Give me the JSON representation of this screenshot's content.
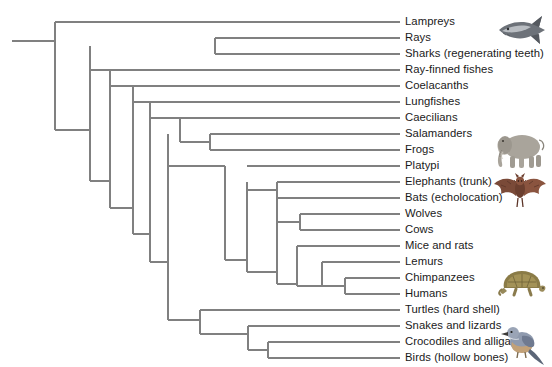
{
  "figure": {
    "name": "vertebrate-cladogram",
    "background_color": "#ffffff",
    "line_color": "#808080",
    "text_color": "#1a1a1a"
  },
  "taxa": [
    {
      "id": "lampreys",
      "label": "Lampreys",
      "y": 22,
      "tip_x": 400,
      "node_x": 55
    },
    {
      "id": "rays",
      "label": "Rays",
      "y": 38,
      "tip_x": 400,
      "node_x": 215
    },
    {
      "id": "sharks",
      "label": "Sharks (regenerating teeth)",
      "y": 54,
      "tip_x": 400,
      "node_x": 215
    },
    {
      "id": "rayfinned",
      "label": "Ray-finned fishes",
      "y": 70,
      "tip_x": 400,
      "node_x": 90
    },
    {
      "id": "coelacanths",
      "label": "Coelacanths",
      "y": 86,
      "tip_x": 400,
      "node_x": 110
    },
    {
      "id": "lungfishes",
      "label": "Lungfishes",
      "y": 102,
      "tip_x": 400,
      "node_x": 133
    },
    {
      "id": "caecilians",
      "label": "Caecilians",
      "y": 118,
      "tip_x": 400,
      "node_x": 180
    },
    {
      "id": "salamanders",
      "label": "Salamanders",
      "y": 134,
      "tip_x": 400,
      "node_x": 210
    },
    {
      "id": "frogs",
      "label": "Frogs",
      "y": 150,
      "tip_x": 400,
      "node_x": 210
    },
    {
      "id": "platypi",
      "label": "Platypi",
      "y": 166,
      "tip_x": 400,
      "node_x": 247
    },
    {
      "id": "elephants",
      "label": "Elephants (trunk)",
      "y": 182,
      "tip_x": 400,
      "node_x": 277
    },
    {
      "id": "bats",
      "label": "Bats (echolocation)",
      "y": 198,
      "tip_x": 400,
      "node_x": 277
    },
    {
      "id": "wolves",
      "label": "Wolves",
      "y": 214,
      "tip_x": 400,
      "node_x": 300
    },
    {
      "id": "cows",
      "label": "Cows",
      "y": 230,
      "tip_x": 400,
      "node_x": 300
    },
    {
      "id": "mice",
      "label": "Mice and rats",
      "y": 246,
      "tip_x": 400,
      "node_x": 297
    },
    {
      "id": "lemurs",
      "label": "Lemurs",
      "y": 262,
      "tip_x": 400,
      "node_x": 322
    },
    {
      "id": "chimps",
      "label": "Chimpanzees",
      "y": 278,
      "tip_x": 400,
      "node_x": 345
    },
    {
      "id": "humans",
      "label": "Humans",
      "y": 294,
      "tip_x": 400,
      "node_x": 345
    },
    {
      "id": "turtles",
      "label": "Turtles (hard shell)",
      "y": 310,
      "tip_x": 400,
      "node_x": 200
    },
    {
      "id": "snakes",
      "label": "Snakes and lizards",
      "y": 326,
      "tip_x": 400,
      "node_x": 248
    },
    {
      "id": "crocodiles",
      "label": "Crocodiles and alligators",
      "y": 342,
      "tip_x": 400,
      "node_x": 268
    },
    {
      "id": "birds",
      "label": "Birds (hollow bones)",
      "y": 358,
      "tip_x": 400,
      "node_x": 268
    }
  ],
  "nodes": [
    {
      "id": "root",
      "x": 55,
      "y_top": 22,
      "y_bottom": 130
    },
    {
      "id": "gnathostomes",
      "x": 90,
      "y_top": 46,
      "y_bottom": 181
    },
    {
      "id": "chondrichthyes",
      "x": 215,
      "y_top": 38,
      "y_bottom": 54
    },
    {
      "id": "bony-vertebrates",
      "x": 110,
      "y_top": 70,
      "y_bottom": 208
    },
    {
      "id": "sarcopterygii",
      "x": 133,
      "y_top": 86,
      "y_bottom": 234
    },
    {
      "id": "tetrapods",
      "x": 150,
      "y_top": 102,
      "y_bottom": 262
    },
    {
      "id": "amphibians",
      "x": 180,
      "y_top": 118,
      "y_bottom": 142
    },
    {
      "id": "frog-salamander",
      "x": 210,
      "y_top": 134,
      "y_bottom": 150
    },
    {
      "id": "amniotes",
      "x": 168,
      "y_top": 134,
      "y_bottom": 320
    },
    {
      "id": "mammals",
      "x": 225,
      "y_top": 166,
      "y_bottom": 260
    },
    {
      "id": "theria",
      "x": 247,
      "y_top": 182,
      "y_bottom": 272
    },
    {
      "id": "laurasiatheria",
      "x": 277,
      "y_top": 190,
      "y_bottom": 222
    },
    {
      "id": "afrotheria-bats",
      "x": 277,
      "y_top": 182,
      "y_bottom": 198
    },
    {
      "id": "euarchontoglires",
      "x": 277,
      "y_top": 222,
      "y_bottom": 284
    },
    {
      "id": "carnivora",
      "x": 300,
      "y_top": 214,
      "y_bottom": 230
    },
    {
      "id": "glires-primates",
      "x": 297,
      "y_top": 246,
      "y_bottom": 286
    },
    {
      "id": "primates",
      "x": 322,
      "y_top": 262,
      "y_bottom": 286
    },
    {
      "id": "apes",
      "x": 345,
      "y_top": 278,
      "y_bottom": 294
    },
    {
      "id": "reptiles",
      "x": 200,
      "y_top": 310,
      "y_bottom": 334
    },
    {
      "id": "diapsids",
      "x": 248,
      "y_top": 326,
      "y_bottom": 350
    },
    {
      "id": "archosaurs",
      "x": 268,
      "y_top": 342,
      "y_bottom": 358
    }
  ],
  "artwork": [
    {
      "id": "shark-art",
      "name": "shark-illustration",
      "x": 496,
      "y": 10,
      "w": 52,
      "h": 42
    },
    {
      "id": "elephant-art",
      "name": "elephant-illustration",
      "x": 492,
      "y": 128,
      "w": 56,
      "h": 42
    },
    {
      "id": "bat-art",
      "name": "bat-illustration",
      "x": 492,
      "y": 172,
      "w": 56,
      "h": 40
    },
    {
      "id": "turtle-art",
      "name": "turtle-illustration",
      "x": 496,
      "y": 262,
      "w": 52,
      "h": 42
    },
    {
      "id": "bird-art",
      "name": "bird-illustration",
      "x": 500,
      "y": 322,
      "w": 48,
      "h": 44
    }
  ],
  "root_stem": {
    "x_start": 12,
    "x_end": 55,
    "y": 41
  }
}
